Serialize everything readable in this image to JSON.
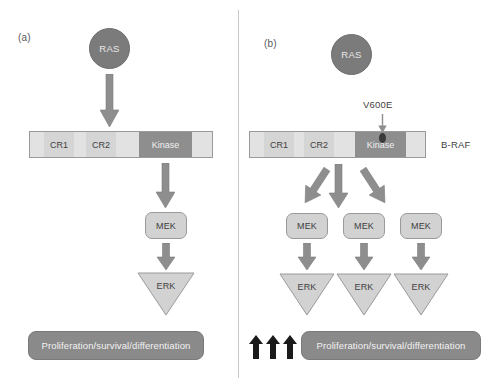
{
  "figure": {
    "panels": [
      {
        "id": "a",
        "label": "(a)",
        "ras_label": "RAS",
        "protein": {
          "segments": [
            {
              "name": "pad-left",
              "label": "",
              "type": "pale"
            },
            {
              "name": "cr1",
              "label": "CR1",
              "type": "cr"
            },
            {
              "name": "gap-1",
              "label": "",
              "type": "pale"
            },
            {
              "name": "cr2",
              "label": "CR2",
              "type": "cr"
            },
            {
              "name": "gap-2",
              "label": "",
              "type": "pale"
            },
            {
              "name": "kinase",
              "label": "Kinase",
              "type": "kinase"
            },
            {
              "name": "pad-right",
              "label": "",
              "type": "pale"
            }
          ]
        },
        "mek_label": "MEK",
        "erk_label": "ERK",
        "outcome_label": "Proliferation/survival/differentiation",
        "mek_count": 1,
        "erk_count": 1,
        "upregulated": false
      },
      {
        "id": "b",
        "label": "(b)",
        "ras_label": "RAS",
        "mutation_label": "V600E",
        "protein_name": "B-RAF",
        "protein": {
          "segments": [
            {
              "name": "pad-left",
              "label": "",
              "type": "pale"
            },
            {
              "name": "cr1",
              "label": "CR1",
              "type": "cr"
            },
            {
              "name": "gap-1",
              "label": "",
              "type": "pale"
            },
            {
              "name": "cr2",
              "label": "CR2",
              "type": "cr"
            },
            {
              "name": "gap-2",
              "label": "",
              "type": "pale"
            },
            {
              "name": "kinase",
              "label": "Kinase",
              "type": "kinase"
            },
            {
              "name": "pad-right",
              "label": "",
              "type": "pale"
            }
          ]
        },
        "mek_label": "MEK",
        "erk_label": "ERK",
        "outcome_label": "Proliferation/survival/differentiation",
        "mek_count": 3,
        "erk_count": 3,
        "upregulated": true,
        "upregulation_arrow_count": 3
      }
    ],
    "colors": {
      "ras_fill": "#7b7b7b",
      "arrow_fill": "#8e8e8e",
      "kinase_fill": "#8e8e8e",
      "cr_fill": "#d5d5d5",
      "protein_pale_fill": "#e2e2e2",
      "mek_fill": "#d2d2d2",
      "erk_fill": "#d2d2d2",
      "outcome_fill": "#8a8a8a",
      "mutation_dot": "#3a3a3a",
      "up_arrow_fill": "#1a1a1a",
      "divider": "#c8c8c8",
      "background": "#ffffff"
    }
  }
}
